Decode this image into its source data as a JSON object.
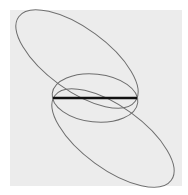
{
  "canvas": {
    "width": 188,
    "height": 195,
    "background": "#ffffff"
  },
  "panel": {
    "x": 10,
    "y": 10,
    "width": 172,
    "height": 176,
    "fill": "#ececec"
  },
  "stroke_colors": {
    "ellipse": "#6e6e6e",
    "segment": "#111111"
  },
  "shapes": {
    "upper_ellipse": {
      "cx": 77,
      "cy": 59,
      "rx": 72,
      "ry": 31,
      "rotation": 36
    },
    "lower_ellipse": {
      "cx": 113,
      "cy": 138,
      "rx": 72,
      "ry": 31,
      "rotation": 36
    },
    "middle_ellipse": {
      "cx": 95,
      "cy": 98,
      "rx": 43,
      "ry": 24,
      "rotation": 6
    },
    "segment": {
      "x1": 53,
      "y1": 98,
      "x2": 137,
      "y2": 98,
      "width": 2.6
    }
  }
}
